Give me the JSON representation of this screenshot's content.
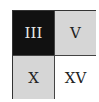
{
  "grid": {
    "cells": [
      {
        "label": "III",
        "bg": "#111111",
        "fg": "#e8e8e8"
      },
      {
        "label": "V",
        "bg": "#d6d6d6",
        "fg": "#222222"
      },
      {
        "label": "X",
        "bg": "#d6d6d6",
        "fg": "#222222"
      },
      {
        "label": "XV",
        "bg": "#ffffff",
        "fg": "#222222"
      }
    ]
  }
}
